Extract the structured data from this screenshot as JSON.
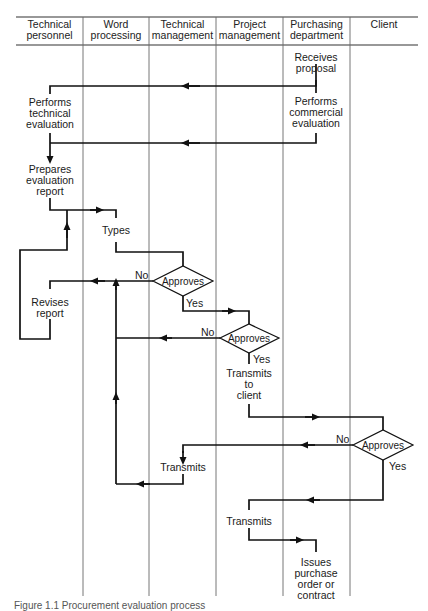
{
  "diagram": {
    "type": "swimlane-flowchart",
    "lanes": [
      {
        "id": "tech-personnel",
        "label": "Technical\npersonnel",
        "line1": "Technical",
        "line2": "personnel"
      },
      {
        "id": "word-processing",
        "label": "Word processing",
        "line1": "Word",
        "line2": "processing"
      },
      {
        "id": "tech-management",
        "label": "Technical management",
        "line1": "Technical",
        "line2": "management"
      },
      {
        "id": "project-management",
        "label": "Project management",
        "line1": "Project",
        "line2": "management"
      },
      {
        "id": "purchasing",
        "label": "Purchasing department",
        "line1": "Purchasing",
        "line2": "department"
      },
      {
        "id": "client",
        "label": "Client",
        "line1": "Client",
        "line2": ""
      }
    ],
    "nodes": {
      "receives_proposal": {
        "l1": "Receives",
        "l2": "proposal"
      },
      "performs_technical": {
        "l1": "Performs",
        "l2": "technical",
        "l3": "evaluation"
      },
      "performs_commercial": {
        "l1": "Performs",
        "l2": "commercial",
        "l3": "evaluation"
      },
      "prepares_report": {
        "l1": "Prepares",
        "l2": "evaluation",
        "l3": "report"
      },
      "types": {
        "l1": "Types"
      },
      "revises_report": {
        "l1": "Revises",
        "l2": "report"
      },
      "approves_tech": {
        "l1": "Approves"
      },
      "approves_project": {
        "l1": "Approves"
      },
      "transmits_to_client": {
        "l1": "Transmits",
        "l2": "to",
        "l3": "client"
      },
      "approves_client": {
        "l1": "Approves"
      },
      "transmits_no": {
        "l1": "Transmits"
      },
      "transmits_yes": {
        "l1": "Transmits"
      },
      "issues_po": {
        "l1": "Issues",
        "l2": "purchase",
        "l3": "order or",
        "l4": "contract"
      }
    },
    "decision_labels": {
      "tech_no": "No",
      "tech_yes": "Yes",
      "project_no": "No",
      "project_yes": "Yes",
      "client_no": "No",
      "client_yes": "Yes"
    },
    "caption": "Figure 1.1  Procurement evaluation process"
  }
}
